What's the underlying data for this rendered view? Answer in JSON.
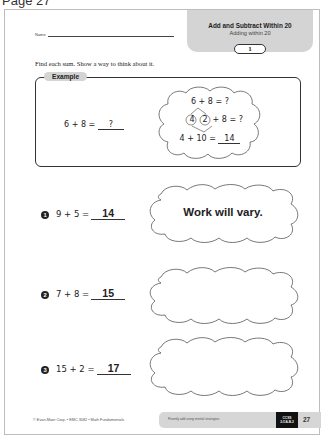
{
  "page_label": "Page 27",
  "worksheet": {
    "name_label": "Name",
    "header": {
      "title": "Add and Subtract Within 20",
      "subtitle": "Adding within 20",
      "unit_number": "1"
    },
    "instructions": "Find each sum. Show a way to think about it.",
    "example": {
      "tab_label": "Example",
      "equation": "6 + 8 =",
      "blank_value": "?",
      "thinking": {
        "line1": "6 + 8 = ?",
        "split_left": "4",
        "split_right": "2",
        "line2_rest": "+ 8 = ?",
        "line3": "4 + 10 =",
        "line3_answer": "14"
      }
    },
    "problems": [
      {
        "number": "1",
        "equation": "9 + 5 =",
        "answer": "14",
        "work_text": "Work will vary."
      },
      {
        "number": "2",
        "equation": "7 + 8 =",
        "answer": "15",
        "work_text": ""
      },
      {
        "number": "3",
        "equation": "15 + 2 =",
        "answer": "17",
        "work_text": ""
      }
    ],
    "footer": {
      "copyright": "© Evan-Moor Corp. • EMC 3082 • Math Fundamentals",
      "objective": "Fluently add using mental strategies.",
      "ccss_line1": "CCSS",
      "ccss_line2": "2.OA.B.2",
      "page_number": "27"
    }
  },
  "colors": {
    "header_gray": "#d4d4d4",
    "ink": "#222222",
    "badge_black": "#111111"
  }
}
